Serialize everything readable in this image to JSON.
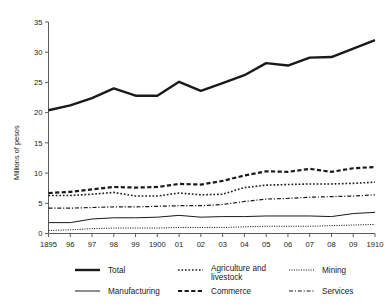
{
  "chart_data": {
    "type": "line",
    "title": "",
    "xlabel": "",
    "ylabel": "Millions of pesos",
    "ylim": [
      0,
      35
    ],
    "yticks": [
      0,
      5,
      10,
      15,
      20,
      25,
      30,
      35
    ],
    "grid": false,
    "legend_position": "bottom",
    "x": [
      1895,
      1896,
      1897,
      1898,
      1899,
      1900,
      1901,
      1902,
      1903,
      1904,
      1905,
      1906,
      1907,
      1908,
      1909,
      1910
    ],
    "categories": [
      "1895",
      "96",
      "97",
      "98",
      "99",
      "1900",
      "01",
      "02",
      "03",
      "04",
      "05",
      "06",
      "07",
      "08",
      "09",
      "1910"
    ],
    "series": [
      {
        "name": "Total",
        "style": "solid-thick",
        "values": [
          20.4,
          21.2,
          22.4,
          24.0,
          22.8,
          22.8,
          25.1,
          23.6,
          24.9,
          26.2,
          28.2,
          27.8,
          29.1,
          29.2,
          30.6,
          32.0
        ]
      },
      {
        "name": "Agriculture and livestock",
        "style": "dotted",
        "values": [
          6.3,
          6.3,
          6.5,
          6.8,
          6.2,
          6.2,
          6.7,
          6.4,
          6.5,
          7.6,
          8.0,
          8.1,
          8.2,
          8.2,
          8.3,
          8.5
        ]
      },
      {
        "name": "Mining",
        "style": "fine-dotted",
        "values": [
          0.5,
          0.6,
          0.8,
          0.9,
          0.9,
          0.9,
          1.0,
          1.0,
          1.0,
          1.1,
          1.2,
          1.2,
          1.2,
          1.3,
          1.4,
          1.5
        ]
      },
      {
        "name": "Manufacturing",
        "style": "solid-thin",
        "values": [
          1.8,
          1.8,
          2.4,
          2.6,
          2.6,
          2.7,
          3.0,
          2.7,
          2.8,
          2.8,
          2.9,
          2.9,
          2.9,
          2.8,
          3.3,
          3.5
        ]
      },
      {
        "name": "Commerce",
        "style": "dashed",
        "values": [
          6.7,
          6.9,
          7.3,
          7.7,
          7.6,
          7.7,
          8.2,
          8.1,
          8.7,
          9.6,
          10.3,
          10.2,
          10.7,
          10.2,
          10.8,
          11.0
        ]
      },
      {
        "name": "Services",
        "style": "dash-dot",
        "values": [
          4.2,
          4.2,
          4.3,
          4.4,
          4.4,
          4.5,
          4.6,
          4.6,
          4.8,
          5.3,
          5.7,
          5.8,
          6.0,
          6.1,
          6.2,
          6.4
        ]
      }
    ]
  },
  "legend": {
    "entries": [
      {
        "label": "Total",
        "key": "total"
      },
      {
        "label": "Agriculture and",
        "key": "agriculture-1"
      },
      {
        "label": "livestock",
        "key": "agriculture-2"
      },
      {
        "label": "Mining",
        "key": "mining"
      },
      {
        "label": "Manufacturing",
        "key": "manufacturing"
      },
      {
        "label": "Commerce",
        "key": "commerce"
      },
      {
        "label": "Services",
        "key": "services"
      }
    ]
  },
  "colors": {
    "line": "#1a1a1a",
    "axis": "#5a5a5a",
    "background": "#ffffff"
  }
}
